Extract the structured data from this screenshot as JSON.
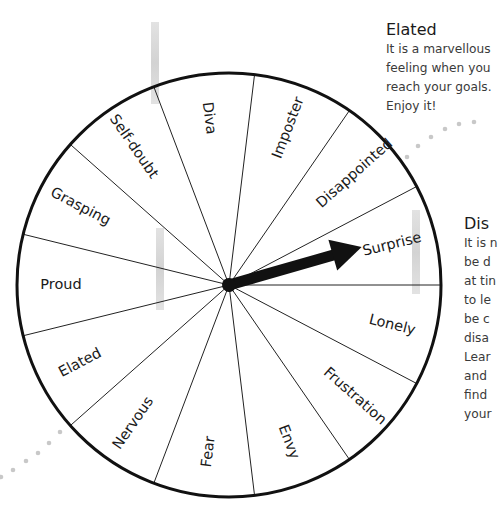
{
  "wheel": {
    "segments": [
      {
        "label": "Surprise"
      },
      {
        "label": "Disappointed"
      },
      {
        "label": "Imposter"
      },
      {
        "label": "Diva"
      },
      {
        "label": "Self-doubt"
      },
      {
        "label": "Grasping"
      },
      {
        "label": "Proud"
      },
      {
        "label": "Elated"
      },
      {
        "label": "Nervous"
      },
      {
        "label": "Fear"
      },
      {
        "label": "Envy"
      },
      {
        "label": "Frustration"
      },
      {
        "label": "Lonely"
      }
    ],
    "pointer_target": "Surprise"
  },
  "cards": {
    "elated": {
      "title": "Elated",
      "body": "It is a marvellous\nfeeling when you\nreach your goals.\nEnjoy it!"
    },
    "disappointed": {
      "title": "Dis",
      "body": "It is n\nbe d\nat tin\nto le\nbe c\ndisa\nLear\nand \nfind \nyour"
    }
  },
  "colors": {
    "ink": "#111111",
    "dots": "#c8c8c8",
    "text": "#333333"
  }
}
